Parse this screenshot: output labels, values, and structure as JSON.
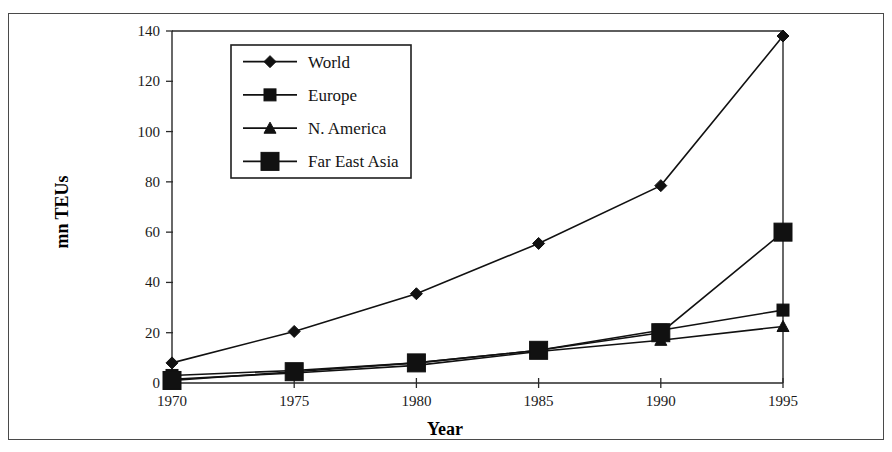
{
  "chart_data": {
    "type": "line",
    "title": "",
    "xlabel": "Year",
    "ylabel": "mn TEUs",
    "x": [
      1970,
      1975,
      1980,
      1985,
      1990,
      1995
    ],
    "xtick_labels": [
      "1970",
      "1975",
      "1980",
      "1985",
      "1990",
      "1995"
    ],
    "ytick_labels": [
      "0",
      "20",
      "40",
      "60",
      "80",
      "100",
      "120",
      "140"
    ],
    "yticks": [
      0,
      20,
      40,
      60,
      80,
      100,
      120,
      140
    ],
    "xlim": [
      1970,
      1995
    ],
    "ylim": [
      0,
      140
    ],
    "grid": false,
    "legend_position": "top-left-inside",
    "series": [
      {
        "name": "World",
        "marker": "diamond",
        "marker_size": "medium",
        "values": [
          8,
          20.5,
          35.5,
          55.5,
          78.5,
          138
        ]
      },
      {
        "name": "Europe",
        "marker": "square",
        "marker_size": "small",
        "values": [
          3,
          5,
          8,
          13,
          21,
          29
        ]
      },
      {
        "name": "N. America",
        "marker": "triangle",
        "marker_size": "small",
        "values": [
          1.5,
          4,
          7,
          12.5,
          17,
          22.5
        ]
      },
      {
        "name": "Far East Asia",
        "marker": "square",
        "marker_size": "large",
        "values": [
          1,
          4.5,
          8,
          13,
          20,
          60
        ]
      }
    ]
  },
  "colors": {
    "line": "#111111",
    "marker": "#111111",
    "axis": "#2a2a2a",
    "frame": "#4a4a4a",
    "background": "#ffffff",
    "text": "#141414"
  },
  "figure": {
    "outer_border": true,
    "plot_frame": true
  }
}
